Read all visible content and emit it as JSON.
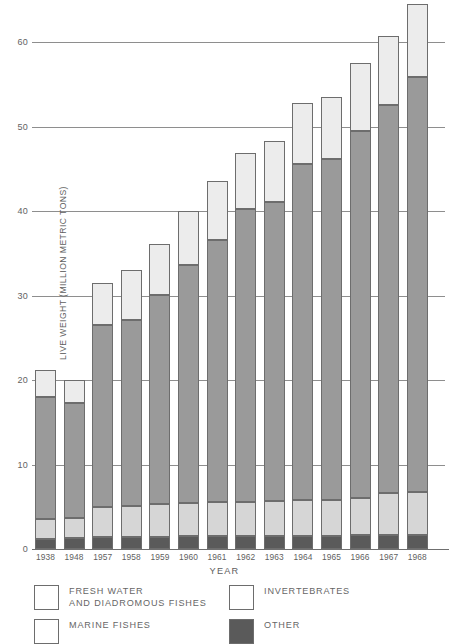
{
  "chart_data": {
    "type": "bar",
    "subtype": "stacked-bar",
    "title": "",
    "xlabel": "YEAR",
    "ylabel": "LIVE WEIGHT (MILLION METRIC TONS)",
    "ylim": [
      0,
      65
    ],
    "ytick_labels": [
      "0",
      "10",
      "20",
      "30",
      "40",
      "50",
      "60"
    ],
    "yticks": [
      0,
      10,
      20,
      30,
      40,
      50,
      60
    ],
    "grid": "horizontal",
    "legend_position": "below-axes",
    "categories": [
      "1938",
      "1948",
      "1957",
      "1958",
      "1959",
      "1960",
      "1961",
      "1962",
      "1963",
      "1964",
      "1965",
      "1966",
      "1967",
      "1968"
    ],
    "series": [
      {
        "name": "OTHER",
        "color": "#5a5a5a",
        "values": [
          1.2,
          1.3,
          1.4,
          1.4,
          1.4,
          1.5,
          1.5,
          1.5,
          1.5,
          1.5,
          1.5,
          1.6,
          1.6,
          1.6
        ]
      },
      {
        "name": "FRESH WATER AND DIADROMOUS FISHES",
        "color": "#d6d6d6",
        "values": [
          2.3,
          2.4,
          3.6,
          3.7,
          3.9,
          4.0,
          4.1,
          4.1,
          4.2,
          4.3,
          4.3,
          4.4,
          5.0,
          5.1
        ]
      },
      {
        "name": "MARINE FISHES",
        "color": "#9a9a9a",
        "values": [
          14.5,
          13.6,
          21.5,
          22.0,
          24.8,
          28.1,
          31.0,
          34.6,
          35.4,
          39.8,
          40.3,
          43.5,
          45.9,
          49.1
        ]
      },
      {
        "name": "INVERTEBRATES",
        "color": "#ececec",
        "values": [
          3.2,
          2.7,
          5.0,
          5.9,
          6.0,
          6.4,
          6.9,
          6.7,
          7.2,
          7.2,
          7.4,
          8.0,
          8.2,
          8.7
        ]
      }
    ],
    "totals": [
      21.2,
      20.0,
      31.5,
      33.0,
      36.1,
      40.0,
      43.5,
      46.9,
      48.3,
      52.8,
      53.5,
      57.5,
      60.7,
      64.5
    ]
  },
  "legend": {
    "items": [
      {
        "id": "fresh-water",
        "label": "FRESH WATER\nAND DIADROMOUS FISHES",
        "swatch": "white"
      },
      {
        "id": "marine",
        "label": "MARINE FISHES",
        "swatch": "white"
      },
      {
        "id": "invertebrates",
        "label": "INVERTEBRATES",
        "swatch": "white"
      },
      {
        "id": "other",
        "label": "OTHER",
        "swatch": "#5a5a5a"
      }
    ]
  },
  "colors": {
    "other": "#5a5a5a",
    "fresh_water": "#d6d6d6",
    "marine": "#9a9a9a",
    "invertebrates": "#ececec",
    "gridline": "#8e8e8e",
    "text": "#5e5e5e"
  }
}
